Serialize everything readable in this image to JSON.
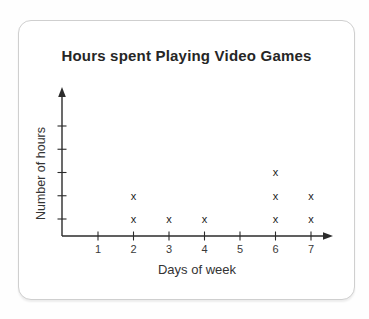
{
  "card": {
    "title": "Hours spent Playing Video Games"
  },
  "chart_data": {
    "type": "scatter",
    "subtype": "dot-plot-with-x-markers",
    "title": "Hours spent Playing Video Games",
    "xlabel": "Days of week",
    "ylabel": "Number of hours",
    "categories": [
      "1",
      "2",
      "3",
      "4",
      "5",
      "6",
      "7"
    ],
    "counts_per_day": [
      0,
      2,
      1,
      1,
      0,
      3,
      2
    ],
    "points": [
      {
        "x": 2,
        "y": 1
      },
      {
        "x": 2,
        "y": 2
      },
      {
        "x": 3,
        "y": 1
      },
      {
        "x": 4,
        "y": 1
      },
      {
        "x": 6,
        "y": 1
      },
      {
        "x": 6,
        "y": 2
      },
      {
        "x": 6,
        "y": 3
      },
      {
        "x": 7,
        "y": 1
      },
      {
        "x": 7,
        "y": 2
      }
    ],
    "marker": "x",
    "y_ticks_unlabeled_count": 5,
    "xlim": [
      0,
      8
    ],
    "ylim": [
      0,
      6
    ],
    "grid": false,
    "legend": false,
    "axis_color": "#2b2b2b",
    "marker_color": "#222222",
    "tick_label_color": "#3a3a3a"
  }
}
